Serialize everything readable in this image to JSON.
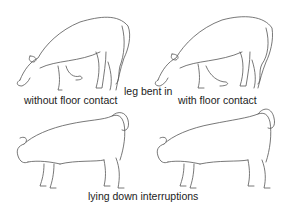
{
  "figure": {
    "labels": {
      "top_left": "without floor contact",
      "top_center": "leg bent in",
      "top_right": "with floor contact",
      "bottom_center": "lying down interruptions"
    },
    "panels": [
      {
        "position": "top-left",
        "subject": "cow grazing with front leg bent in, without floor contact"
      },
      {
        "position": "top-right",
        "subject": "cow grazing with front leg bent in, with floor contact"
      },
      {
        "position": "bottom-left",
        "subject": "cow standing with head lowered and tail raised"
      },
      {
        "position": "bottom-right",
        "subject": "cow standing with head lowered and tail raised"
      }
    ]
  }
}
